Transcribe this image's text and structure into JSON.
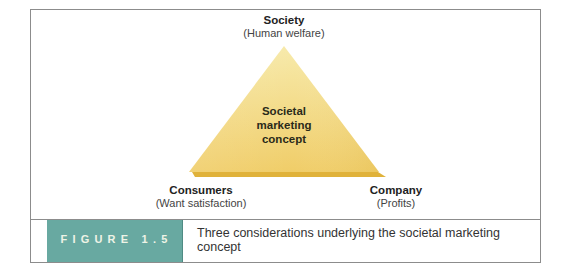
{
  "diagram": {
    "type": "triangle",
    "apex": {
      "title": "Society",
      "subtitle": "(Human welfare)"
    },
    "bottom_left": {
      "title": "Consumers",
      "subtitle": "(Want satisfaction)"
    },
    "bottom_right": {
      "title": "Company",
      "subtitle": "(Profits)"
    },
    "center": {
      "lines": [
        "Societal",
        "marketing",
        "concept"
      ]
    },
    "colors": {
      "triangle_top": "#f6e8a6",
      "triangle_bottom": "#f0cd68",
      "triangle_base": "#e0b23a",
      "figure_tag": "#68a9a1",
      "border": "#8c8c8c"
    }
  },
  "caption": {
    "figure_label": "FIGURE 1.5",
    "text": "Three considerations underlying the societal marketing concept"
  }
}
